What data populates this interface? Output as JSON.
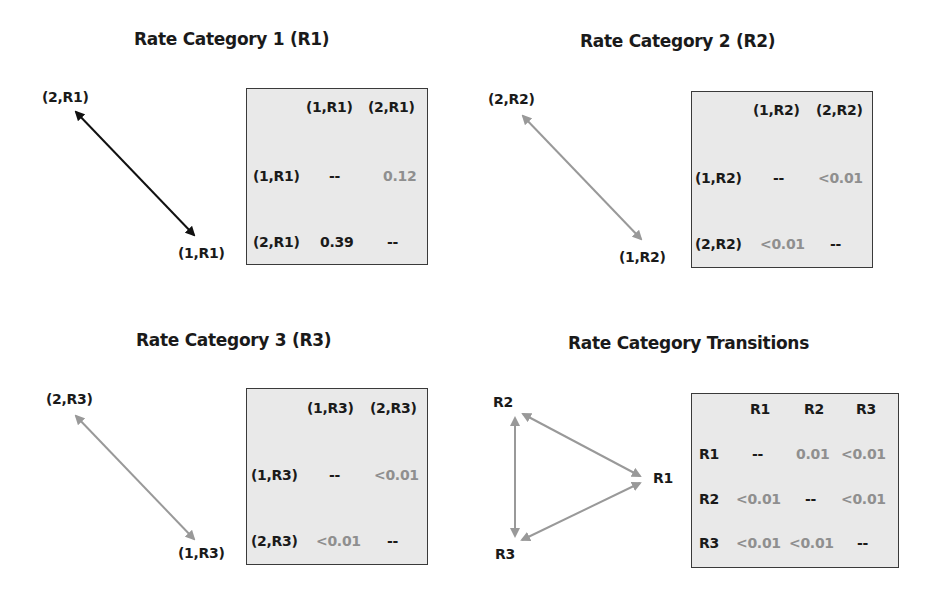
{
  "panels": [
    {
      "title": "Rate Category 1 (R1)",
      "nodes": [
        "(2,R1)",
        "(1,R1)"
      ],
      "arrow_color": "#111111",
      "table": {
        "col_headers": [
          "(1,R1)",
          "(2,R1)"
        ],
        "rows": [
          {
            "label": "(1,R1)",
            "values": [
              "--",
              "0.12"
            ]
          },
          {
            "label": "(2,R1)",
            "values": [
              "0.39",
              "--"
            ]
          }
        ]
      }
    },
    {
      "title": "Rate Category 2 (R2)",
      "nodes": [
        "(2,R2)",
        "(1,R2)"
      ],
      "arrow_color": "#999999",
      "table": {
        "col_headers": [
          "(1,R2)",
          "(2,R2)"
        ],
        "rows": [
          {
            "label": "(1,R2)",
            "values": [
              "--",
              "<0.01"
            ]
          },
          {
            "label": "(2,R2)",
            "values": [
              "<0.01",
              "--"
            ]
          }
        ]
      }
    },
    {
      "title": "Rate Category 3 (R3)",
      "nodes": [
        "(2,R3)",
        "(1,R3)"
      ],
      "arrow_color": "#999999",
      "table": {
        "col_headers": [
          "(1,R3)",
          "(2,R3)"
        ],
        "rows": [
          {
            "label": "(1,R3)",
            "values": [
              "--",
              "<0.01"
            ]
          },
          {
            "label": "(2,R3)",
            "values": [
              "<0.01",
              "--"
            ]
          }
        ]
      }
    },
    {
      "title": "Rate Category Transitions",
      "nodes": [
        "R2",
        "R1",
        "R3"
      ],
      "arrow_color": "#999999",
      "table": {
        "col_headers": [
          "R1",
          "R2",
          "R3"
        ],
        "rows": [
          {
            "label": "R1",
            "values": [
              "--",
              "0.01",
              "<0.01"
            ]
          },
          {
            "label": "R2",
            "values": [
              "<0.01",
              "--",
              "<0.01"
            ]
          },
          {
            "label": "R3",
            "values": [
              "<0.01",
              "<0.01",
              "--"
            ]
          }
        ]
      }
    }
  ],
  "colors": {
    "strong_value": "#1a1a1a",
    "weak_value": "#8f8f8f",
    "table_background": "#e9e9e9",
    "table_border": "#3a3a3a"
  }
}
